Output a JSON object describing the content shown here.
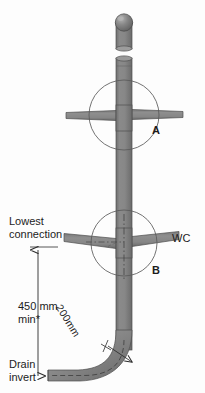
{
  "diagram": {
    "canvas": {
      "width": 205,
      "height": 393
    },
    "colors": {
      "background": "#fdfdfd",
      "pipe_fill": "#808080",
      "pipe_fill_light": "#8d8d8d",
      "pipe_fill_dark": "#6e6e6e",
      "pipe_stroke": "#4f4f4f",
      "cap_fill": "#7a7a7a",
      "cap_highlight": "#a8a8a8",
      "line": "#2b2b2b",
      "circle_stroke": "#555555",
      "text": "#1c1c1c"
    },
    "labels": {
      "lowest_connection": "Lowest\nconnection",
      "lowest_connection_line1": "Lowest",
      "lowest_connection_line2": "connection",
      "wc": "WC",
      "detail_a": "A",
      "detail_b": "B",
      "min_height_line1": "450 mm",
      "min_height_line2": "min*",
      "bend_radius": "200mm",
      "drain_invert_line1": "Drain",
      "drain_invert_line2": "invert"
    },
    "dimensions": {
      "min_height_value": "450 mm",
      "min_height_qualifier": "min*",
      "bend_radius_value": "200mm"
    },
    "components": [
      {
        "name": "vent-cap",
        "label": "domed vent cap"
      },
      {
        "name": "vent-stub-pipe",
        "label": "vent stub pipe"
      },
      {
        "name": "vertical-soil-stack",
        "label": "vertical soil stack"
      },
      {
        "name": "branch-pipe-upper",
        "label": "upper horizontal branch pipe"
      },
      {
        "name": "branch-pipe-lower-left",
        "label": "lower left branch pipe"
      },
      {
        "name": "branch-pipe-wc",
        "label": "WC branch pipe"
      },
      {
        "name": "swept-bend",
        "label": "swept 90 degree bend"
      },
      {
        "name": "drain-pipe",
        "label": "horizontal drain pipe"
      },
      {
        "name": "detail-circle-a",
        "label": "detail circle A"
      },
      {
        "name": "detail-circle-b",
        "label": "detail circle B"
      },
      {
        "name": "height-dimension-line",
        "label": "450 mm minimum height dimension"
      },
      {
        "name": "radius-dimension-leader",
        "label": "200mm bend radius leader"
      }
    ]
  }
}
